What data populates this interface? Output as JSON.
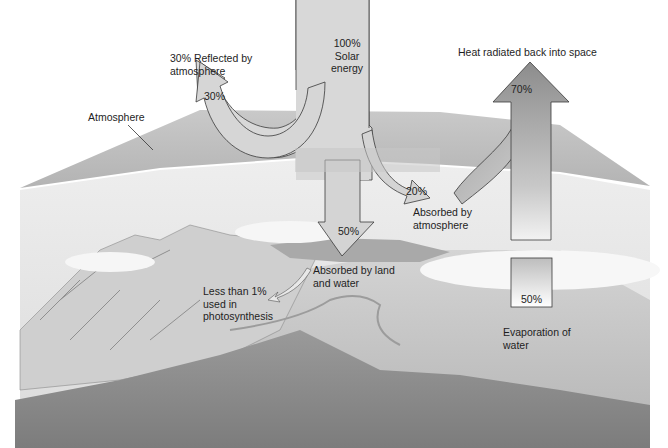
{
  "diagram": {
    "labels": {
      "solar": [
        "100%",
        "Solar",
        "energy"
      ],
      "reflected": [
        "30% Reflected by",
        "atmosphere"
      ],
      "reflected_pct": "30%",
      "atmosphere": "Atmosphere",
      "heat_radiated": "Heat radiated back into space",
      "heat_pct": "70%",
      "absorbed_atm_pct": "20%",
      "absorbed_atm": [
        "Absorbed by",
        "atmosphere"
      ],
      "absorbed_land_pct": "50%",
      "absorbed_land": [
        "Absorbed by land",
        "and water"
      ],
      "photosynthesis": [
        "Less than 1%",
        "used in",
        "photosynthesis"
      ],
      "evaporation_pct": "50%",
      "evaporation": [
        "Evaporation of",
        "water"
      ]
    },
    "colors": {
      "arrow_light": "#d9d9d9",
      "arrow_dark": "#8f8f8f",
      "atmosphere": "#bdbdbd",
      "land": "#8a8a8a",
      "water": "#c4c4c4",
      "outline": "#3a3a3a"
    }
  }
}
